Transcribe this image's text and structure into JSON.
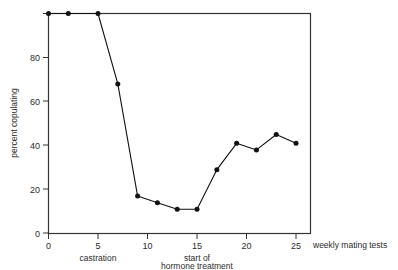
{
  "chart_data": {
    "type": "line",
    "title": "",
    "xlabel": "weekly mating tests",
    "ylabel": "percent copulating",
    "xlim": [
      -1,
      26.5
    ],
    "ylim": [
      0,
      100
    ],
    "grid": false,
    "legend": null,
    "x": [
      0,
      2,
      5,
      7,
      9,
      11,
      13,
      15,
      17,
      19,
      21,
      23,
      25
    ],
    "values": [
      100,
      100,
      100,
      68,
      17,
      14,
      11,
      11,
      29,
      41,
      38,
      45,
      41
    ],
    "series": [
      {
        "name": "percent copulating",
        "x": [
          0,
          2,
          5,
          7,
          9,
          11,
          13,
          15,
          17,
          19,
          21,
          23,
          25
        ],
        "values": [
          100,
          100,
          100,
          68,
          17,
          14,
          11,
          11,
          29,
          41,
          38,
          45,
          41
        ]
      }
    ],
    "xticks": [
      0,
      5,
      10,
      15,
      20,
      25
    ],
    "xticklabels": [
      "0",
      "5",
      "10",
      "15",
      "20",
      "25"
    ],
    "yticks": [
      0,
      20,
      40,
      60,
      80,
      100
    ],
    "yticklabels": [
      "0",
      "20",
      "40",
      "60",
      "80",
      ""
    ],
    "annotations": [
      {
        "text": "castration",
        "x": 5,
        "position": "below-axis"
      },
      {
        "text": "start of",
        "x": 15,
        "position": "below-axis"
      },
      {
        "text": "hormone treatment",
        "x": 15,
        "position": "below-axis-2"
      }
    ],
    "colors": {
      "line": "#111111",
      "marker": "#111111",
      "axis": "#333333",
      "background": "#ffffff"
    }
  },
  "axes": {
    "y_title": "percent copulating",
    "x_title": "weekly mating tests",
    "y_tick_0": "0",
    "y_tick_20": "20",
    "y_tick_40": "40",
    "y_tick_60": "60",
    "y_tick_80": "80",
    "x_tick_0": "0",
    "x_tick_5": "5",
    "x_tick_10": "10",
    "x_tick_15": "15",
    "x_tick_20": "20",
    "x_tick_25": "25"
  },
  "annotations": {
    "castration": "castration",
    "hormone_line1": "start of",
    "hormone_line2": "hormone treatment"
  }
}
